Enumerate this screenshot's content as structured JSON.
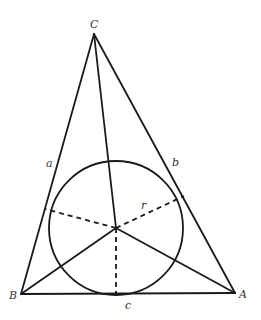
{
  "diagram": {
    "vertices": {
      "A": {
        "label": "A",
        "x": 235,
        "y": 293
      },
      "B": {
        "label": "B",
        "x": 21,
        "y": 294
      },
      "C": {
        "label": "C",
        "x": 94,
        "y": 34
      }
    },
    "sides": {
      "a": {
        "label": "a"
      },
      "b": {
        "label": "b"
      },
      "c": {
        "label": "c"
      }
    },
    "incircle": {
      "cx": 116,
      "cy": 228,
      "r": 67,
      "radius_label": "r"
    },
    "tangent_points": {
      "on_a": {
        "x": 45,
        "y": 209
      },
      "on_b": {
        "x": 184,
        "y": 196
      },
      "on_c": {
        "x": 116,
        "y": 294
      }
    },
    "stroke_color": "#1a1a1a",
    "label_color": "#333333"
  }
}
